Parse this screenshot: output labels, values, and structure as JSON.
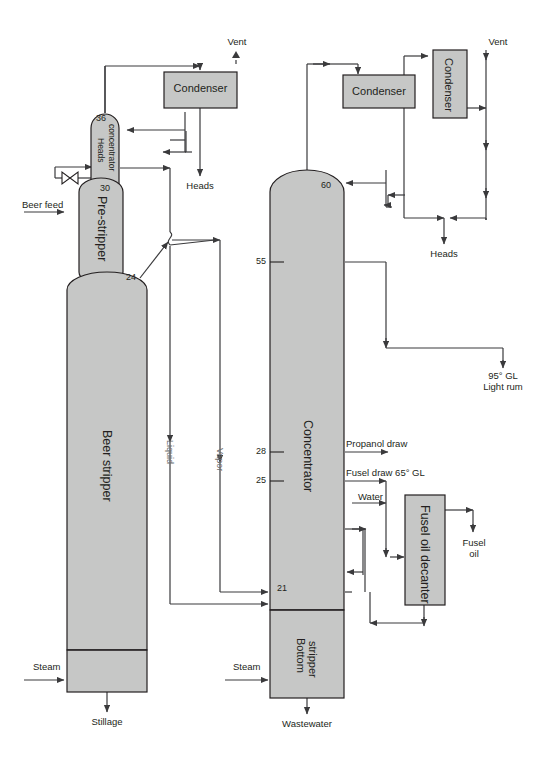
{
  "diagram": {
    "colors": {
      "vessel_fill": "#c6c7c6",
      "vessel_stroke": "#231f20",
      "line": "#3a3a3c",
      "text": "#231f20",
      "flow_label": "#6d6e70",
      "background": "#ffffff"
    }
  },
  "vessels": {
    "heads_concentrator": {
      "label": "Heads\nconcentrator",
      "top_stage": "36",
      "bottom_stage": "30"
    },
    "pre_stripper": {
      "label": "Pre-stripper",
      "bottom_stage": "24"
    },
    "beer_stripper": {
      "label": "Beer stripper"
    },
    "concentrator": {
      "label": "Concentrator",
      "top_stage": "60",
      "draw_stage_55": "55",
      "draw_stage_28": "28",
      "draw_stage_25": "25",
      "bottom_stage": "21"
    },
    "bottom_stripper": {
      "label": "Bottom\nstripper"
    },
    "fusel_oil_decanter": {
      "label": "Fusel oil decanter"
    }
  },
  "equipment": {
    "condenser_left": {
      "label": "Condenser"
    },
    "condenser_mid": {
      "label": "Condenser"
    },
    "condenser_right": {
      "label": "Condenser"
    }
  },
  "streams": {
    "vent_left": "Vent",
    "vent_right": "Vent",
    "heads_left": "Heads",
    "heads_right": "Heads",
    "beer_feed": "Beer feed",
    "liquid": "Liquid",
    "vapor": "Vapor",
    "steam_left": "Steam",
    "steam_right": "Steam",
    "stillage": "Stillage",
    "wastewater": "Wastewater",
    "light_rum": "95° GL\nLight rum",
    "propanol_draw": "Propanol draw",
    "fusel_draw": "Fusel draw 65° GL",
    "water": "Water",
    "fusel_oil": "Fusel\noil"
  },
  "stage_numbers": {
    "s36": "36",
    "s30": "30",
    "s24": "24",
    "s60": "60",
    "s55": "55",
    "s28": "28",
    "s25": "25",
    "s21": "21"
  }
}
